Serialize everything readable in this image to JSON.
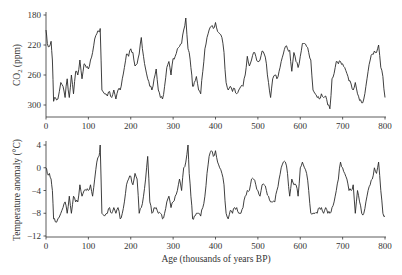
{
  "chart_data": [
    {
      "type": "line",
      "title": "",
      "xlabel": "",
      "ylabel": "CO2 (ppm)",
      "xlim": [
        0,
        800
      ],
      "ylim": [
        170,
        302
      ],
      "xticks": [
        0,
        100,
        200,
        300,
        400,
        500,
        600,
        700,
        800
      ],
      "yticks": [
        180,
        220,
        260,
        300
      ],
      "grid": false,
      "series": [
        {
          "name": "CO2",
          "x": [
            0,
            3,
            8,
            12,
            15,
            18,
            22,
            28,
            35,
            40,
            45,
            50,
            55,
            60,
            65,
            70,
            75,
            80,
            85,
            90,
            95,
            100,
            105,
            110,
            115,
            120,
            125,
            128,
            132,
            138,
            145,
            150,
            155,
            160,
            165,
            170,
            175,
            180,
            185,
            190,
            195,
            200,
            205,
            210,
            215,
            220,
            225,
            230,
            235,
            240,
            245,
            250,
            255,
            260,
            265,
            270,
            275,
            280,
            285,
            290,
            295,
            300,
            305,
            310,
            315,
            320,
            325,
            330,
            335,
            338,
            342,
            346,
            350,
            355,
            360,
            365,
            370,
            375,
            380,
            385,
            390,
            395,
            400,
            405,
            410,
            415,
            420,
            425,
            430,
            435,
            440,
            445,
            450,
            455,
            460,
            465,
            470,
            475,
            480,
            485,
            490,
            495,
            500,
            505,
            510,
            515,
            520,
            525,
            530,
            535,
            540,
            545,
            550,
            555,
            560,
            565,
            570,
            575,
            580,
            585,
            590,
            595,
            600,
            605,
            610,
            615,
            620,
            625,
            630,
            635,
            640,
            645,
            650,
            655,
            660,
            665,
            670,
            675,
            680,
            685,
            690,
            695,
            700,
            705,
            710,
            715,
            720,
            725,
            730,
            735,
            740,
            745,
            750,
            755,
            760,
            765,
            770,
            775,
            780,
            785,
            790,
            795,
            800
          ],
          "values": [
            280,
            262,
            258,
            265,
            240,
            185,
            190,
            188,
            210,
            205,
            190,
            215,
            190,
            220,
            195,
            225,
            220,
            240,
            215,
            235,
            230,
            228,
            240,
            250,
            268,
            275,
            278,
            282,
            200,
            195,
            192,
            198,
            190,
            200,
            188,
            200,
            200,
            215,
            230,
            248,
            245,
            255,
            250,
            232,
            235,
            248,
            270,
            245,
            228,
            215,
            205,
            200,
            215,
            228,
            200,
            190,
            188,
            205,
            230,
            238,
            220,
            242,
            245,
            255,
            258,
            262,
            280,
            296,
            255,
            250,
            230,
            205,
            210,
            218,
            200,
            195,
            225,
            255,
            270,
            280,
            285,
            282,
            290,
            278,
            275,
            270,
            250,
            210,
            200,
            205,
            198,
            202,
            195,
            200,
            205,
            205,
            220,
            245,
            232,
            240,
            250,
            245,
            238,
            240,
            252,
            248,
            235,
            210,
            190,
            215,
            220,
            215,
            225,
            238,
            248,
            258,
            255,
            253,
            225,
            250,
            238,
            230,
            245,
            262,
            262,
            258,
            250,
            240,
            200,
            195,
            190,
            188,
            195,
            190,
            192,
            180,
            175,
            215,
            222,
            238,
            235,
            238,
            235,
            230,
            222,
            212,
            208,
            200,
            210,
            195,
            186,
            183,
            188,
            205,
            225,
            240,
            248,
            252,
            250,
            260,
            230,
            218,
            190
          ]
        }
      ]
    },
    {
      "type": "line",
      "title": "",
      "xlabel": "Age (thousands of years BP)",
      "ylabel": "Temperature anomaly (°C)",
      "xlim": [
        0,
        800
      ],
      "ylim": [
        -12.2,
        4.5
      ],
      "xticks": [
        0,
        100,
        200,
        300,
        400,
        500,
        600,
        700,
        800
      ],
      "yticks": [
        4,
        0,
        -4,
        -8,
        -12
      ],
      "grid": false,
      "series": [
        {
          "name": "Temperature anomaly",
          "x": [
            0,
            3,
            8,
            12,
            15,
            18,
            22,
            28,
            35,
            40,
            45,
            50,
            55,
            60,
            65,
            70,
            75,
            80,
            85,
            90,
            95,
            100,
            105,
            110,
            115,
            120,
            125,
            128,
            132,
            138,
            145,
            150,
            155,
            160,
            165,
            170,
            175,
            180,
            185,
            190,
            195,
            200,
            205,
            210,
            215,
            220,
            225,
            230,
            235,
            240,
            245,
            250,
            255,
            260,
            265,
            270,
            275,
            280,
            285,
            290,
            295,
            300,
            305,
            310,
            315,
            320,
            325,
            330,
            335,
            338,
            342,
            346,
            350,
            355,
            360,
            365,
            370,
            375,
            380,
            385,
            390,
            395,
            400,
            405,
            410,
            415,
            420,
            425,
            430,
            435,
            440,
            445,
            450,
            455,
            460,
            465,
            470,
            475,
            480,
            485,
            490,
            495,
            500,
            505,
            510,
            515,
            520,
            525,
            530,
            535,
            540,
            545,
            550,
            555,
            560,
            565,
            570,
            575,
            580,
            585,
            590,
            595,
            600,
            605,
            610,
            615,
            620,
            625,
            630,
            635,
            640,
            645,
            650,
            655,
            660,
            665,
            670,
            675,
            680,
            685,
            690,
            695,
            700,
            705,
            710,
            715,
            720,
            725,
            730,
            735,
            740,
            745,
            750,
            755,
            760,
            765,
            770,
            775,
            780,
            785,
            790,
            795,
            800
          ],
          "values": [
            0,
            -1,
            -1,
            -2,
            -4,
            -9,
            -9.5,
            -9,
            -8,
            -7,
            -6,
            -8,
            -5,
            -8,
            -5,
            -6,
            -6,
            -3,
            -5,
            -4,
            -4,
            -4,
            -3,
            -5,
            -2,
            1,
            2,
            4,
            -8,
            -8.5,
            -8,
            -7,
            -8,
            -7,
            -8,
            -7,
            -9,
            -8,
            -6,
            -3,
            -2,
            -1.5,
            -3,
            -1,
            -2,
            -8,
            -7,
            -5,
            -2,
            2,
            -6,
            -8,
            -7,
            -7,
            -8,
            -8,
            -9,
            -8,
            -6,
            -5,
            -7,
            -6,
            -5,
            -4,
            -2,
            -4,
            0,
            1,
            4,
            -1,
            -5,
            -9,
            -8.5,
            -8,
            -8,
            -8.5,
            -7,
            -5,
            -1,
            2,
            3,
            2,
            3,
            1,
            0,
            -1,
            -3,
            -8,
            -9,
            -7.5,
            -8,
            -7,
            -7,
            -8,
            -8,
            -7,
            -5,
            -4,
            -4,
            -2,
            -2,
            -3,
            -4,
            -5,
            -3,
            -3,
            -4,
            -5,
            -6,
            -6,
            -6,
            -4,
            -2,
            0,
            1,
            1,
            -1,
            -5,
            -2,
            -3,
            -3,
            -5,
            0,
            1,
            0,
            -1,
            -4,
            -8,
            -8,
            -8,
            -8,
            -7,
            -7,
            -8,
            -7,
            -8,
            -8,
            -7,
            -6,
            -4,
            -2,
            1,
            0,
            -1,
            -2,
            -4,
            -4,
            -3,
            -8,
            -4,
            -6,
            -8,
            -8,
            -6,
            -4,
            -3,
            -2,
            0,
            -1,
            1,
            -4,
            -8,
            -8.5
          ]
        }
      ]
    }
  ],
  "labels": {
    "top_ylabel_main": "CO",
    "top_ylabel_sub": "2",
    "top_ylabel_unit": " (ppm)",
    "bottom_ylabel": "Temperature anomaly (°C)",
    "xlabel": "Age (thousands of years BP)"
  },
  "ticks": {
    "x": [
      "0",
      "100",
      "200",
      "300",
      "400",
      "500",
      "600",
      "700",
      "800"
    ],
    "top_y": [
      "300",
      "260",
      "220",
      "180"
    ],
    "bottom_y": [
      "4",
      "0",
      "−4",
      "−8",
      "−12"
    ]
  },
  "colors": {
    "line": "#2a2a2a",
    "axis": "#333333"
  }
}
